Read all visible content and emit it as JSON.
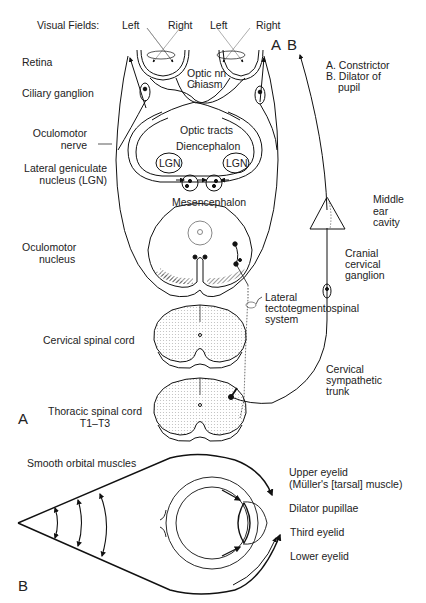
{
  "panel_a": {
    "panel_label": "A",
    "visual_fields_label": "Visual Fields:",
    "field_left_1": "Left",
    "field_right_1": "Right",
    "field_left_2": "Left",
    "field_right_2": "Right",
    "left_labels": {
      "retina": "Retina",
      "ciliary_ganglion": "Ciliary ganglion",
      "oculomotor_nerve_1": "Oculomotor",
      "oculomotor_nerve_2": "nerve",
      "lgn_1": "Lateral geniculate",
      "lgn_2": "nucleus (LGN)",
      "oculomotor_nucleus_1": "Oculomotor",
      "oculomotor_nucleus_2": "nucleus",
      "cervical_cord": "Cervical spinal cord",
      "thoracic_cord_1": "Thoracic spinal cord",
      "thoracic_cord_2": "T1–T3"
    },
    "inner_labels": {
      "optic_nn": "Optic nn",
      "chiasm": "Chiasm",
      "optic_tracts": "Optic tracts",
      "diencephalon": "Diencephalon",
      "lgn_left": "LGN",
      "lgn_right": "LGN",
      "mesencephalon": "Mesencephalon"
    },
    "path_a": "A",
    "path_b": "B",
    "legend": {
      "a": "A. Constrictor",
      "b_1": "B. Dilator of",
      "b_2": "pupil"
    },
    "right_labels": {
      "middle_ear_1": "Middle",
      "middle_ear_2": "ear",
      "middle_ear_3": "cavity",
      "cranial_cervical_1": "Cranial",
      "cranial_cervical_2": "cervical",
      "cranial_cervical_3": "ganglion",
      "lateral_tts_1": "Lateral",
      "lateral_tts_2": "tectotegmentospinal",
      "lateral_tts_3": "system",
      "cervical_symp_1": "Cervical",
      "cervical_symp_2": "sympathetic",
      "cervical_symp_3": "trunk"
    }
  },
  "panel_b": {
    "panel_label": "B",
    "smooth_orbital": "Smooth orbital muscles",
    "upper_eyelid_1": "Upper eyelid",
    "upper_eyelid_2": "(Müller's [tarsal] muscle)",
    "dilator_pupillae": "Dilator pupillae",
    "third_eyelid": "Third eyelid",
    "lower_eyelid": "Lower eyelid"
  }
}
